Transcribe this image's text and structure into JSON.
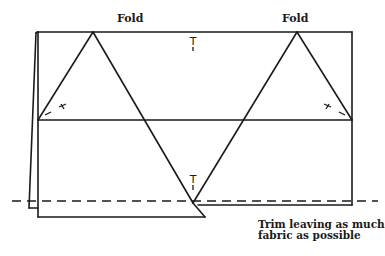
{
  "labels": {
    "fold_left": "Fold",
    "fold_right": "Fold",
    "trim_line1": "Trim leaving as much",
    "trim_line2": "fabric as possible"
  },
  "markers": {
    "top_center": "T",
    "bottom_center": "T"
  },
  "colors": {
    "ink": "#1a1a1a",
    "background": "#ffffff"
  }
}
